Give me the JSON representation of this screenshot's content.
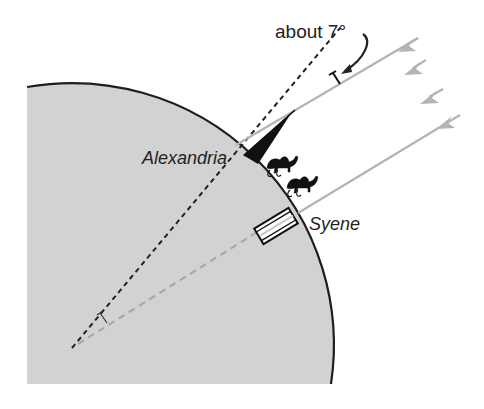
{
  "diagram": {
    "labels": {
      "angle": "about 7°",
      "city_north": "Alexandria",
      "city_south": "Syene"
    },
    "colors": {
      "earth_fill": "#d2d2d2",
      "earth_outline": "#1e1e1e",
      "sun_rays": "#b4b4b4",
      "shadow": "#111111",
      "dashed_alexandria": "#222222",
      "dashed_syene": "#a8a8a8"
    },
    "icons": [
      "sun-ray-arrow",
      "camel-icon",
      "obelisk-icon",
      "well-icon",
      "curved-arrow-icon",
      "angle-marker-icon"
    ]
  }
}
